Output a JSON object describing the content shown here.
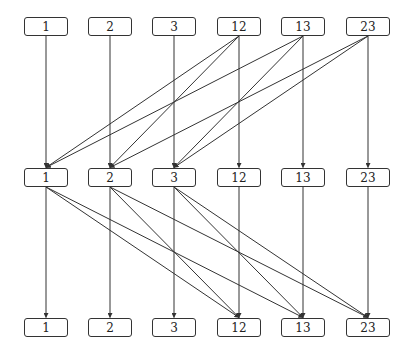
{
  "diagram": {
    "type": "layered-graph",
    "layers": [
      {
        "id": "top",
        "y": 17,
        "nodes": [
          "1",
          "2",
          "3",
          "12",
          "13",
          "23"
        ]
      },
      {
        "id": "middle",
        "y": 168,
        "nodes": [
          "1",
          "2",
          "3",
          "12",
          "13",
          "23"
        ]
      },
      {
        "id": "bottom",
        "y": 318,
        "nodes": [
          "1",
          "2",
          "3",
          "12",
          "13",
          "23"
        ]
      }
    ],
    "node_x": [
      24,
      88,
      152,
      217,
      281,
      346
    ],
    "edges": [
      {
        "from": [
          "top",
          0
        ],
        "to": [
          "middle",
          0
        ]
      },
      {
        "from": [
          "top",
          1
        ],
        "to": [
          "middle",
          1
        ]
      },
      {
        "from": [
          "top",
          2
        ],
        "to": [
          "middle",
          2
        ]
      },
      {
        "from": [
          "top",
          3
        ],
        "to": [
          "middle",
          3
        ]
      },
      {
        "from": [
          "top",
          4
        ],
        "to": [
          "middle",
          4
        ]
      },
      {
        "from": [
          "top",
          5
        ],
        "to": [
          "middle",
          5
        ]
      },
      {
        "from": [
          "top",
          3
        ],
        "to": [
          "middle",
          0
        ]
      },
      {
        "from": [
          "top",
          3
        ],
        "to": [
          "middle",
          1
        ]
      },
      {
        "from": [
          "top",
          4
        ],
        "to": [
          "middle",
          0
        ]
      },
      {
        "from": [
          "top",
          4
        ],
        "to": [
          "middle",
          2
        ]
      },
      {
        "from": [
          "top",
          5
        ],
        "to": [
          "middle",
          1
        ]
      },
      {
        "from": [
          "top",
          5
        ],
        "to": [
          "middle",
          2
        ]
      },
      {
        "from": [
          "middle",
          0
        ],
        "to": [
          "bottom",
          0
        ]
      },
      {
        "from": [
          "middle",
          1
        ],
        "to": [
          "bottom",
          1
        ]
      },
      {
        "from": [
          "middle",
          2
        ],
        "to": [
          "bottom",
          2
        ]
      },
      {
        "from": [
          "middle",
          3
        ],
        "to": [
          "bottom",
          3
        ]
      },
      {
        "from": [
          "middle",
          4
        ],
        "to": [
          "bottom",
          4
        ]
      },
      {
        "from": [
          "middle",
          5
        ],
        "to": [
          "bottom",
          5
        ]
      },
      {
        "from": [
          "middle",
          0
        ],
        "to": [
          "bottom",
          3
        ]
      },
      {
        "from": [
          "middle",
          0
        ],
        "to": [
          "bottom",
          4
        ]
      },
      {
        "from": [
          "middle",
          1
        ],
        "to": [
          "bottom",
          3
        ]
      },
      {
        "from": [
          "middle",
          1
        ],
        "to": [
          "bottom",
          5
        ]
      },
      {
        "from": [
          "middle",
          2
        ],
        "to": [
          "bottom",
          4
        ]
      },
      {
        "from": [
          "middle",
          2
        ],
        "to": [
          "bottom",
          5
        ]
      }
    ],
    "colors": {
      "stroke": "#333333",
      "text": "#222222",
      "background": "#ffffff"
    }
  }
}
